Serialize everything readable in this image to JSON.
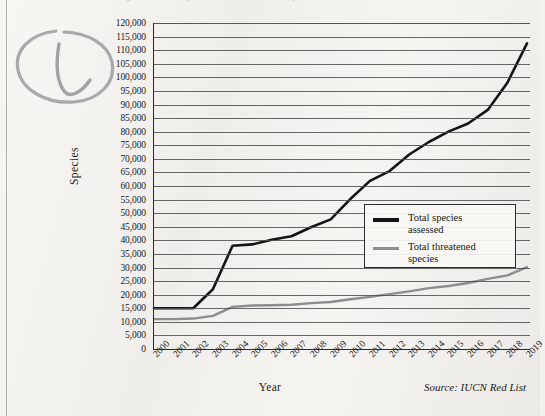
{
  "page": {
    "cut_caption": "Figure: Numbers of species assessed and threatened species, 2000-2019",
    "annotation_name": "handwritten-check-mark"
  },
  "chart_data": {
    "type": "line",
    "title": "",
    "xlabel": "Year",
    "ylabel": "Species",
    "source": "Source: IUCN Red List",
    "grid": true,
    "legend_position": "inside-right",
    "xlim": [
      2000,
      2019
    ],
    "ylim": [
      0,
      120000
    ],
    "ytick_step": 5000,
    "categories": [
      "2000",
      "2001",
      "2002",
      "2003",
      "2004",
      "2005",
      "2006",
      "2007",
      "2008",
      "2009",
      "2010",
      "2011",
      "2012",
      "2013",
      "2014",
      "2015",
      "2016",
      "2017",
      "2018",
      "2019"
    ],
    "yticks": [
      "120,000",
      "115,000",
      "110,000",
      "105,000",
      "100,000",
      "95,000",
      "90,000",
      "85,000",
      "80,000",
      "75,000",
      "70,000",
      "65,000",
      "60,000",
      "55,000",
      "50,000",
      "45,000",
      "40,000",
      "35,000",
      "30,000",
      "25,000",
      "20,000",
      "15,000",
      "10,000",
      "5,000",
      "0"
    ],
    "series": [
      {
        "name": "Total species assessed",
        "legend_label_line1": "Total species",
        "legend_label_line2": "assessed",
        "color": "#141414",
        "width": 2.6,
        "values": [
          15000,
          15000,
          15000,
          22000,
          38000,
          38500,
          40200,
          41500,
          44800,
          47700,
          55200,
          61900,
          65500,
          71600,
          76200,
          80000,
          83000,
          88000,
          98000,
          112500
        ]
      },
      {
        "name": "Total threatened species",
        "legend_label_line1": "Total threatened",
        "legend_label_line2": "species",
        "color": "#8d8d8d",
        "width": 2.4,
        "values": [
          11000,
          11000,
          11200,
          12200,
          15500,
          16000,
          16100,
          16300,
          16900,
          17300,
          18300,
          19200,
          20200,
          21200,
          22400,
          23200,
          24300,
          25800,
          27100,
          30100
        ]
      }
    ]
  }
}
